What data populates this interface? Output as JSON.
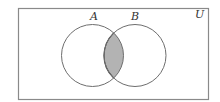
{
  "diagram": {
    "type": "venn",
    "universe": {
      "label": "U",
      "rect": {
        "x": 18.5,
        "y": 8.5,
        "width": 190,
        "height": 91
      },
      "stroke": "#8a8a8a"
    },
    "sets": [
      {
        "label": "A",
        "cx": 92.5,
        "cy": 55.5,
        "r": 31,
        "label_x": 90,
        "label_y": 20
      },
      {
        "label": "B",
        "cx": 135,
        "cy": 55.5,
        "r": 31,
        "label_x": 131,
        "label_y": 20
      }
    ],
    "universe_label_pos": {
      "x": 195,
      "y": 18
    },
    "shaded_region": "A ∩ B",
    "colors": {
      "circle_stroke": "#6e6e6e",
      "shade_fill": "#b3b3b3",
      "shade_stroke": "#4a4a4a",
      "label": "#333333"
    }
  }
}
